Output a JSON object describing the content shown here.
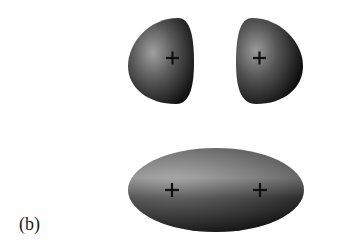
{
  "figure": {
    "panel_label": "(b)",
    "top_row": {
      "description": "two separated orbital lobes",
      "lobes": [
        {
          "name": "left-lobe",
          "sign": "+"
        },
        {
          "name": "right-lobe",
          "sign": "+"
        }
      ]
    },
    "bottom_row": {
      "description": "combined bonding orbital (ellipsoid)",
      "signs": [
        "+",
        "+"
      ]
    },
    "colors": {
      "lobe_dark": "#141414",
      "lobe_highlight": "#9a9a9a",
      "background": "#ffffff"
    }
  }
}
